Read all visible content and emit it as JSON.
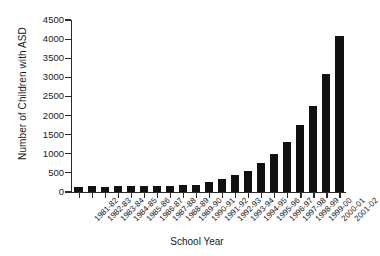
{
  "chart_data": {
    "type": "bar",
    "title": "",
    "xlabel": "School Year",
    "ylabel": "Number of Children with ASD",
    "ylim": [
      0,
      4500
    ],
    "ytick_step": 500,
    "yticks": [
      0,
      500,
      1000,
      1500,
      2000,
      2500,
      3000,
      3500,
      4000,
      4500
    ],
    "ytick_labels": [
      "0",
      "500",
      "1000",
      "1500",
      "2000",
      "2500",
      "3000",
      "3500",
      "4000",
      "4500"
    ],
    "grid": false,
    "legend": false,
    "bar_color": "#111111",
    "categories": [
      "1981-82",
      "1982-83",
      "1983-84",
      "1984-85",
      "1985-86",
      "1986-87",
      "1987-88",
      "1988-89",
      "1989-90",
      "1990-91",
      "1991-92",
      "1992-93",
      "1993-94",
      "1994-95",
      "1995-96",
      "1996-97",
      "1997-98",
      "1998-99",
      "1999-00",
      "2000-01",
      "2001-02"
    ],
    "values": [
      130,
      160,
      130,
      160,
      160,
      160,
      160,
      170,
      175,
      195,
      255,
      335,
      450,
      560,
      750,
      985,
      1305,
      1755,
      2255,
      3100,
      4080
    ]
  }
}
